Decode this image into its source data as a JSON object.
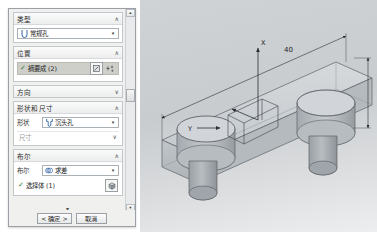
{
  "dialog": {
    "groups": [
      {
        "id": "type",
        "title": "类型",
        "chevron": "∧",
        "combo": {
          "value": "常规孔",
          "icon": "hole-type-icon",
          "arrow": "▾"
        }
      },
      {
        "id": "position",
        "title": "位置",
        "chevron": "∧",
        "selection": {
          "check": "✓",
          "label": "摘要成 (2)"
        },
        "sketch_icon": "sketch-section-icon",
        "point_icon": "add-point-icon"
      },
      {
        "id": "direction",
        "title": "方向",
        "chevron": "∨"
      },
      {
        "id": "shape_size",
        "title": "形状和尺寸",
        "chevron": "∧",
        "shape_label": "形状",
        "shape_value": "沉头孔",
        "shape_icon": "counterbore-icon",
        "shape_arrow": "▾",
        "dimensions_label": "尺寸",
        "dimensions_chevron": "∨"
      },
      {
        "id": "boolean",
        "title": "布尔",
        "chevron": "∧",
        "bool_label": "布尔",
        "bool_value": "求差",
        "bool_icon": "subtract-icon",
        "bool_arrow": "▾",
        "body_check": "✓",
        "body_label": "选择体 (1)",
        "body_icon": "select-body-icon"
      }
    ],
    "collapse_caret": "▾",
    "footer": {
      "ok": "< 确定 >",
      "cancel": "取消"
    },
    "scrollbar": {
      "up": "▴",
      "down": "▾"
    }
  },
  "viewport": {
    "dimension_40": "40",
    "axis_x": "X",
    "axis_y": "Y",
    "colors": {
      "background": "#cfd3d6",
      "solid_face": "#b9bec2",
      "solid_top": "#c9ced2",
      "edge": "#54585c",
      "dimension": "#2b2f33"
    }
  }
}
